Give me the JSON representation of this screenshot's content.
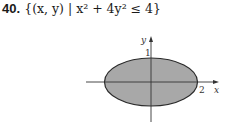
{
  "problem": {
    "number": "40.",
    "expression": "{(x, y) | x² + 4y² ≤ 4}"
  },
  "figure": {
    "x_axis_label": "x",
    "y_axis_label": "y",
    "x_intercept_label": "2",
    "y_intercept_label": "1",
    "fill_color": "#a8a8a8",
    "stroke_color": "#2a2a2a"
  }
}
